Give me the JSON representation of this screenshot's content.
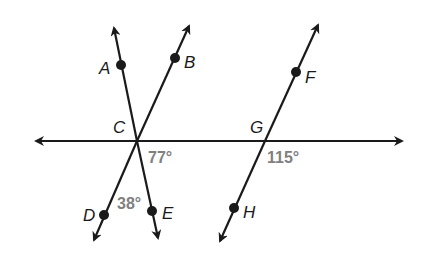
{
  "diagram": {
    "type": "geometry-lines-angles",
    "colors": {
      "line": "#1a1a1a",
      "angle_label": "#808080"
    },
    "points": {
      "A": "A",
      "B": "B",
      "C": "C",
      "D": "D",
      "E": "E",
      "F": "F",
      "G": "G",
      "H": "H"
    },
    "angles": {
      "angle_77": "77°",
      "angle_38": "38°",
      "angle_115": "115°"
    },
    "lines": [
      {
        "name": "horizontal-line",
        "through": [
          "C",
          "G"
        ]
      },
      {
        "name": "line-AE",
        "through": [
          "A",
          "C",
          "E"
        ]
      },
      {
        "name": "line-BD",
        "through": [
          "B",
          "C",
          "D"
        ]
      },
      {
        "name": "line-FH",
        "through": [
          "F",
          "G",
          "H"
        ]
      }
    ]
  }
}
